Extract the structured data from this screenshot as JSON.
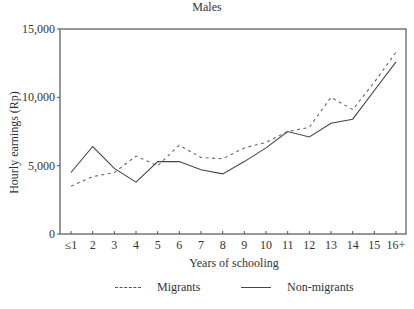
{
  "chart_data": {
    "type": "line",
    "title": "Males",
    "xlabel": "Years of schooling",
    "ylabel": "Hourly earnings (Rp)",
    "categories": [
      "≤1",
      "2",
      "3",
      "4",
      "5",
      "6",
      "7",
      "8",
      "9",
      "10",
      "11",
      "12",
      "13",
      "14",
      "15",
      "16+"
    ],
    "ylim": [
      0,
      15000
    ],
    "yticks": [
      0,
      5000,
      10000,
      15000
    ],
    "ytick_labels": [
      "0",
      "5,000",
      "10,000",
      "15,000"
    ],
    "grid": false,
    "legend_position": "bottom",
    "series": [
      {
        "name": "Migrants",
        "style": "dashed",
        "values": [
          3500,
          4200,
          4500,
          5700,
          5000,
          6500,
          5600,
          5500,
          6300,
          6700,
          7500,
          7800,
          10000,
          9100,
          11100,
          13300
        ]
      },
      {
        "name": "Non-migrants",
        "style": "solid",
        "values": [
          4500,
          6400,
          4800,
          3800,
          5300,
          5300,
          4700,
          4400,
          5300,
          6300,
          7500,
          7100,
          8100,
          8400,
          10500,
          12600
        ]
      }
    ]
  },
  "legend": {
    "migrants": "Migrants",
    "non_migrants": "Non-migrants"
  }
}
